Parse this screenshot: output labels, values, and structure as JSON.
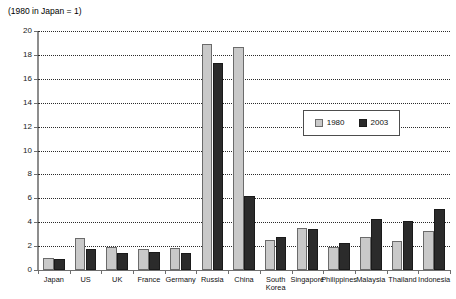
{
  "chart_data": {
    "type": "bar",
    "title": "(1980 in Japan = 1)",
    "xlabel": "",
    "ylabel": "",
    "ylim": [
      0,
      20
    ],
    "ytick_step": 2,
    "yticks": [
      0,
      2,
      4,
      6,
      8,
      10,
      12,
      14,
      16,
      18,
      20
    ],
    "grid": "horizontal-dotted",
    "legend_position": "inside-upper-right",
    "categories": [
      "Japan",
      "US",
      "UK",
      "France",
      "Germany",
      "Russia",
      "China",
      "South Korea",
      "Singapore",
      "Philippines",
      "Malaysia",
      "Thailand",
      "Indonesia"
    ],
    "series": [
      {
        "name": "1980",
        "color": "#c9c9c9",
        "values": [
          1.0,
          2.7,
          1.9,
          1.8,
          1.85,
          18.9,
          18.7,
          2.5,
          3.55,
          1.95,
          2.8,
          2.45,
          3.3
        ]
      },
      {
        "name": "2003",
        "color": "#2b2b2b",
        "values": [
          0.95,
          1.75,
          1.45,
          1.5,
          1.45,
          17.3,
          6.2,
          2.75,
          3.4,
          2.3,
          4.3,
          4.1,
          5.1
        ]
      }
    ]
  },
  "legend": {
    "items": [
      {
        "label": "1980"
      },
      {
        "label": "2003"
      }
    ]
  }
}
